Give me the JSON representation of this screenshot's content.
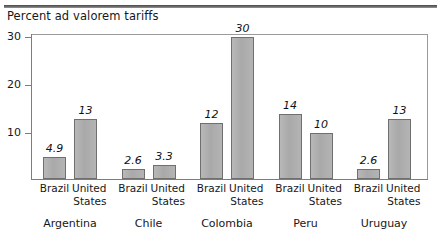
{
  "chart_data": {
    "type": "bar",
    "title": "Percent ad valorem tariffs",
    "xlabel": "",
    "ylabel": "",
    "ylim": [
      0,
      32
    ],
    "yticks": [
      10,
      20,
      30
    ],
    "ytick_labels": [
      "10",
      "20",
      "30"
    ],
    "grid": false,
    "legend": "none",
    "categories": [
      "Argentina",
      "Chile",
      "Colombia",
      "Peru",
      "Uruguay"
    ],
    "series": [
      {
        "name": "Brazil",
        "values": [
          4.9,
          2.6,
          12,
          14,
          2.6
        ],
        "labels": [
          "4.9",
          "2.6",
          "12",
          "14",
          "2.6"
        ]
      },
      {
        "name": "United States",
        "values": [
          13,
          3.3,
          30,
          10,
          13
        ],
        "labels": [
          "13",
          "3.3",
          "30",
          "10",
          "13"
        ]
      }
    ],
    "bar_color": "#aeaeae",
    "bar_edge_color": "#6f6f6f",
    "axis_color": "#7d7d7d",
    "text_color": "#17171a"
  },
  "series_label_lines": {
    "brazil": [
      "Brazil"
    ],
    "united_states": [
      "United",
      "States"
    ]
  }
}
